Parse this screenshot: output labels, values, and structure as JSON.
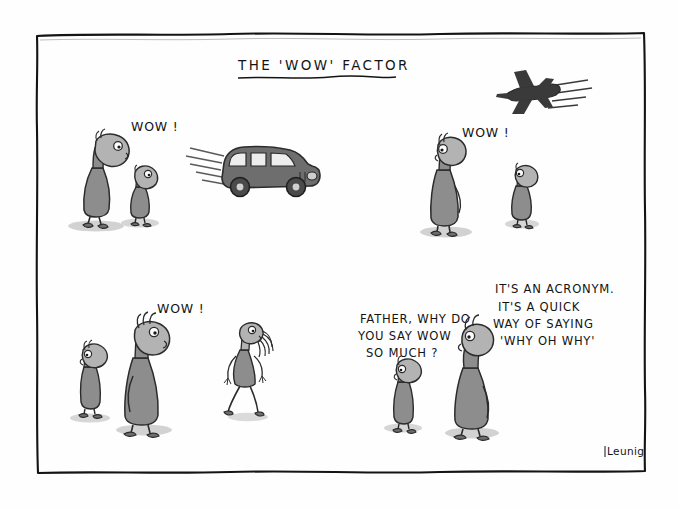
{
  "cartoon": {
    "title": "THE 'WOW' FACTOR",
    "signature": "Leunig",
    "frame_color": "#141414",
    "background_color": "#fefefe",
    "figure_fill": "#8d8d8d",
    "figure_fill_light": "#b3b3b3",
    "figure_outline": "#2b2b2b",
    "vehicle_fill": "#6e6e6e",
    "jet_fill": "#3a3a3a",
    "shadow_color": "#cfcfcf"
  },
  "panels": {
    "top_left": {
      "name": "car-scene",
      "speech": "WOW !",
      "subjects": [
        "adult-figure",
        "child-figure",
        "speeding-car"
      ]
    },
    "top_right": {
      "name": "jet-scene",
      "speech": "WOW !",
      "subjects": [
        "adult-figure",
        "child-figure",
        "fighter-jet"
      ]
    },
    "bottom_left": {
      "name": "woman-scene",
      "speech": "WOW !",
      "subjects": [
        "child-figure",
        "adult-figure",
        "walking-woman"
      ]
    },
    "bottom_right": {
      "name": "conversation-scene",
      "question_lines": [
        "FATHER, WHY DO",
        "YOU SAY WOW",
        "SO MUCH ?"
      ],
      "answer_lines": [
        "IT'S AN ACRONYM.",
        "IT'S A QUICK",
        "WAY OF SAYING",
        "'WHY OH WHY'"
      ],
      "subjects": [
        "child-figure",
        "father-figure"
      ]
    }
  },
  "labels": {
    "wow_1": "WOW !",
    "wow_2": "WOW !",
    "wow_3": "WOW !"
  }
}
